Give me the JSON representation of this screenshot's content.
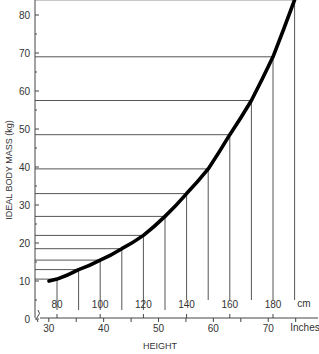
{
  "chart_data": {
    "type": "line",
    "title": "",
    "xlabel": "HEIGHT",
    "ylabel": "IDEAL BODY MASS (kg)",
    "x_unit_primary": "cm",
    "x_unit_secondary": "Inches",
    "ylim": [
      0,
      85
    ],
    "xlim_cm": [
      72,
      195
    ],
    "grid": false,
    "y_ticks": [
      0,
      10,
      20,
      30,
      40,
      50,
      60,
      70,
      80
    ],
    "x_ticks_cm": [
      80,
      100,
      120,
      140,
      160,
      180
    ],
    "x_ticks_inches": [
      30,
      40,
      50,
      60,
      70
    ],
    "x": [
      80,
      90,
      100,
      110,
      120,
      130,
      140,
      150,
      160,
      170,
      180,
      190
    ],
    "series": [
      {
        "name": "Ideal body mass",
        "values": [
          10.5,
          13,
          15.5,
          18.5,
          22,
          27,
          33,
          39.5,
          48.5,
          57.5,
          69,
          84
        ]
      }
    ]
  }
}
